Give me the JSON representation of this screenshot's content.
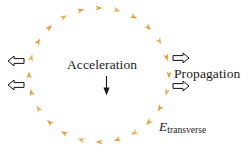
{
  "figure": {
    "background_color": "#ffffff",
    "width": 248,
    "height": 151
  },
  "labels": {
    "acceleration": "Acceleration",
    "propagation": "Propagation",
    "field_symbol": "E",
    "field_subscript": "transverse"
  },
  "colors": {
    "dash_orange": "#E0A040",
    "dash_orange_light": "#EDBE6E",
    "text_black": "#1a1a1a",
    "arrow_outline": "#111111"
  },
  "chart_data": {
    "type": "scatter",
    "circle": {
      "center_x": 99,
      "center_y": 75,
      "radius_x": 70,
      "radius_y": 67,
      "marker_count": 24,
      "marker_shape": "dart",
      "marker_color": "#E0A040"
    },
    "acceleration_arrow": {
      "x": 106,
      "y_start": 76,
      "y_end": 95,
      "direction": "down",
      "style": "solid-filled-head"
    },
    "propagation_arrows": [
      {
        "id": "left-upper",
        "x": 9,
        "y": 61,
        "direction": "left",
        "style": "hollow-outline"
      },
      {
        "id": "left-lower",
        "x": 9,
        "y": 85,
        "direction": "left",
        "style": "hollow-outline"
      },
      {
        "id": "right-upper",
        "x": 175,
        "y": 58,
        "direction": "right",
        "style": "hollow-outline"
      },
      {
        "id": "right-lower",
        "x": 175,
        "y": 86,
        "direction": "right",
        "style": "hollow-outline"
      }
    ],
    "marker_angles_deg": [
      0,
      15,
      30,
      45,
      60,
      75,
      90,
      105,
      120,
      135,
      150,
      165,
      180,
      195,
      210,
      225,
      240,
      255,
      270,
      285,
      300,
      315,
      330,
      345
    ]
  }
}
